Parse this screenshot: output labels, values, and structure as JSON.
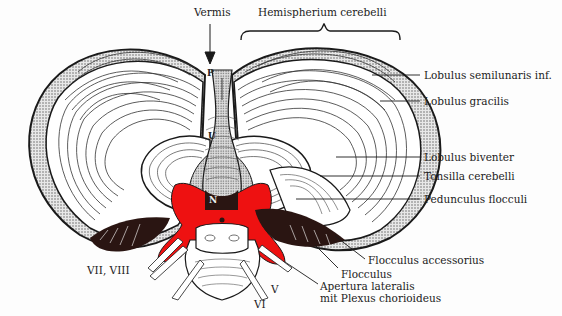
{
  "figure": {
    "colors": {
      "outline": "#1a1a1a",
      "cortex_stipple": "#b5b5b5",
      "highlight_red": "#ee1111",
      "flocculus_dark": "#2a1512",
      "background": "#fdfdfd"
    },
    "top_labels": {
      "vermis": "Vermis",
      "hemisphere": "Hemispherium cerebelli"
    },
    "vermis_letters": {
      "p": "P",
      "u": "U",
      "n": "N"
    },
    "right_labels": [
      {
        "id": "semilunaris",
        "text": "Lobulus semilunaris inf."
      },
      {
        "id": "gracilis",
        "text": "Lobulus gracilis"
      },
      {
        "id": "biventer",
        "text": "Lobulus biventer"
      },
      {
        "id": "tonsilla",
        "text": "Tonsilla cerebelli"
      },
      {
        "id": "pedunculus",
        "text": "Pedunculus flocculi"
      }
    ],
    "bottom_labels": {
      "flocculus_accessorius": "Flocculus accessorius",
      "flocculus": "Flocculus",
      "apertura_line1": "Apertura lateralis",
      "apertura_line2": "mit Plexus chorioideus",
      "nerve_vii_viii": "VII, VIII",
      "nerve_v": "V",
      "nerve_vi": "VI"
    }
  }
}
